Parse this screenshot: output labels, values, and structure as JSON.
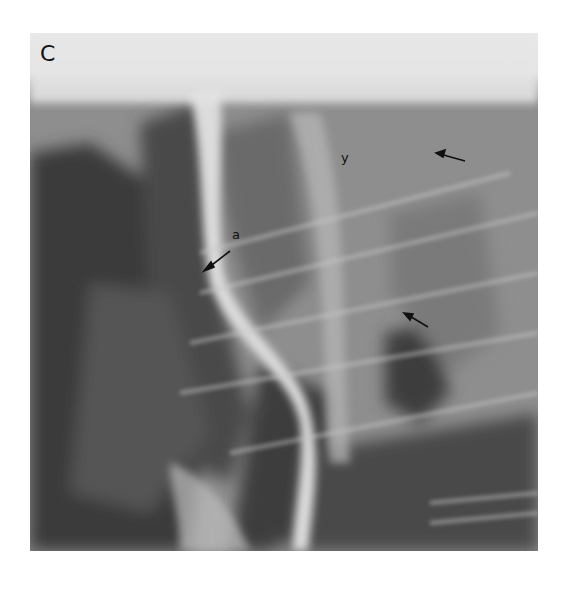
{
  "figure": {
    "panel_label": "C",
    "annotations": [
      {
        "label": "a",
        "type": "letter-with-arrow"
      },
      {
        "label": "y",
        "type": "letter"
      },
      {
        "label": "",
        "type": "arrow",
        "position": "upper-right"
      },
      {
        "label": "",
        "type": "arrow",
        "position": "middle-right"
      }
    ],
    "image_kind": "radiograph"
  }
}
